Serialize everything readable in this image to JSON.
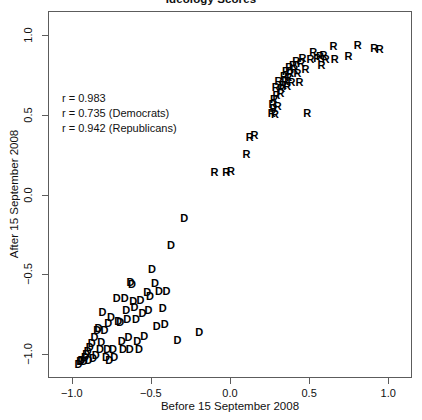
{
  "chart_data": {
    "type": "scatter",
    "title": "Ideology Scores",
    "xlabel": "Before 15 September 2008",
    "ylabel": "After 15 September 2008",
    "xlim": [
      -1.15,
      1.15
    ],
    "ylim": [
      -1.15,
      1.15
    ],
    "xticks": [
      -1.0,
      -0.5,
      0.0,
      0.5,
      1.0
    ],
    "xticklabels": [
      "−1.0",
      "−0.5",
      "0.0",
      "0.5",
      "1.0"
    ],
    "yticks": [
      -1.0,
      -0.5,
      0.0,
      0.5,
      1.0
    ],
    "yticklabels": [
      "−1.0",
      "−0.5",
      "0.0",
      "0.5",
      "1.0"
    ],
    "grid": false,
    "legend": null,
    "marker_style": "text-letter",
    "annotations": [
      {
        "text": "r = 0.983",
        "r": 0.983,
        "group": "All"
      },
      {
        "text": "r = 0.735 (Democrats)",
        "r": 0.735,
        "group": "Democrats"
      },
      {
        "text": "r = 0.942 (Republicans)",
        "r": 0.942,
        "group": "Republicans"
      }
    ],
    "series": [
      {
        "name": "Democrats",
        "marker": "D",
        "color": "#000000",
        "points": [
          [
            -0.963,
            -1.055
          ],
          [
            -0.952,
            -1.04
          ],
          [
            -0.945,
            -1.028
          ],
          [
            -0.93,
            -1.035
          ],
          [
            -0.922,
            -1.012
          ],
          [
            -0.915,
            -0.995
          ],
          [
            -0.905,
            -0.975
          ],
          [
            -0.9,
            -1.03
          ],
          [
            -0.892,
            -0.952
          ],
          [
            -0.88,
            -0.922
          ],
          [
            -0.872,
            -1.018
          ],
          [
            -0.862,
            -0.888
          ],
          [
            -0.855,
            -0.998
          ],
          [
            -0.845,
            -0.845
          ],
          [
            -0.838,
            -0.83
          ],
          [
            -0.828,
            -0.962
          ],
          [
            -0.82,
            -0.918
          ],
          [
            -0.812,
            -0.728
          ],
          [
            -0.8,
            -0.845
          ],
          [
            -0.79,
            -1.01
          ],
          [
            -0.782,
            -0.962
          ],
          [
            -0.775,
            -0.802
          ],
          [
            -0.77,
            -1.028
          ],
          [
            -0.758,
            -0.76
          ],
          [
            -0.745,
            -0.962
          ],
          [
            -0.738,
            -1.012
          ],
          [
            -0.722,
            -0.64
          ],
          [
            -0.712,
            -0.785
          ],
          [
            -0.7,
            -0.795
          ],
          [
            -0.69,
            -0.91
          ],
          [
            -0.682,
            -0.962
          ],
          [
            -0.672,
            -0.645
          ],
          [
            -0.662,
            -0.72
          ],
          [
            -0.655,
            -0.775
          ],
          [
            -0.648,
            -0.888
          ],
          [
            -0.64,
            -0.96
          ],
          [
            -0.635,
            -0.54
          ],
          [
            -0.625,
            -0.555
          ],
          [
            -0.618,
            -0.66
          ],
          [
            -0.61,
            -0.7
          ],
          [
            -0.6,
            -0.775
          ],
          [
            -0.592,
            -0.91
          ],
          [
            -0.582,
            -0.962
          ],
          [
            -0.572,
            -0.655
          ],
          [
            -0.56,
            -0.735
          ],
          [
            -0.548,
            -0.88
          ],
          [
            -0.53,
            -0.602
          ],
          [
            -0.522,
            -0.715
          ],
          [
            -0.512,
            -0.63
          ],
          [
            -0.5,
            -0.462
          ],
          [
            -0.48,
            -0.548
          ],
          [
            -0.47,
            -0.82
          ],
          [
            -0.455,
            -0.598
          ],
          [
            -0.432,
            -0.705
          ],
          [
            -0.418,
            -0.805
          ],
          [
            -0.408,
            -0.598
          ],
          [
            -0.38,
            -0.31
          ],
          [
            -0.338,
            -0.905
          ],
          [
            -0.295,
            -0.142
          ],
          [
            -0.2,
            -0.858
          ]
        ]
      },
      {
        "name": "Republicans",
        "marker": "R",
        "color": "#000000",
        "points": [
          [
            -0.105,
            0.148
          ],
          [
            -0.03,
            0.148
          ],
          [
            0.0,
            0.155
          ],
          [
            0.098,
            0.262
          ],
          [
            0.118,
            0.365
          ],
          [
            0.148,
            0.382
          ],
          [
            0.258,
            0.52
          ],
          [
            0.262,
            0.575
          ],
          [
            0.268,
            0.548
          ],
          [
            0.272,
            0.602
          ],
          [
            0.278,
            0.508
          ],
          [
            0.282,
            0.682
          ],
          [
            0.288,
            0.628
          ],
          [
            0.295,
            0.562
          ],
          [
            0.3,
            0.72
          ],
          [
            0.312,
            0.64
          ],
          [
            0.318,
            0.672
          ],
          [
            0.328,
            0.695
          ],
          [
            0.335,
            0.752
          ],
          [
            0.342,
            0.718
          ],
          [
            0.348,
            0.778
          ],
          [
            0.355,
            0.688
          ],
          [
            0.362,
            0.742
          ],
          [
            0.368,
            0.805
          ],
          [
            0.375,
            0.768
          ],
          [
            0.382,
            0.712
          ],
          [
            0.392,
            0.818
          ],
          [
            0.4,
            0.79
          ],
          [
            0.412,
            0.845
          ],
          [
            0.42,
            0.768
          ],
          [
            0.432,
            0.712
          ],
          [
            0.442,
            0.828
          ],
          [
            0.452,
            0.862
          ],
          [
            0.47,
            0.79
          ],
          [
            0.482,
            0.518
          ],
          [
            0.502,
            0.855
          ],
          [
            0.52,
            0.902
          ],
          [
            0.545,
            0.862
          ],
          [
            0.562,
            0.872
          ],
          [
            0.572,
            0.818
          ],
          [
            0.585,
            0.878
          ],
          [
            0.598,
            0.855
          ],
          [
            0.648,
            0.938
          ],
          [
            0.655,
            0.855
          ],
          [
            0.742,
            0.872
          ],
          [
            0.8,
            0.945
          ],
          [
            0.905,
            0.925
          ],
          [
            0.94,
            0.918
          ]
        ]
      }
    ]
  }
}
